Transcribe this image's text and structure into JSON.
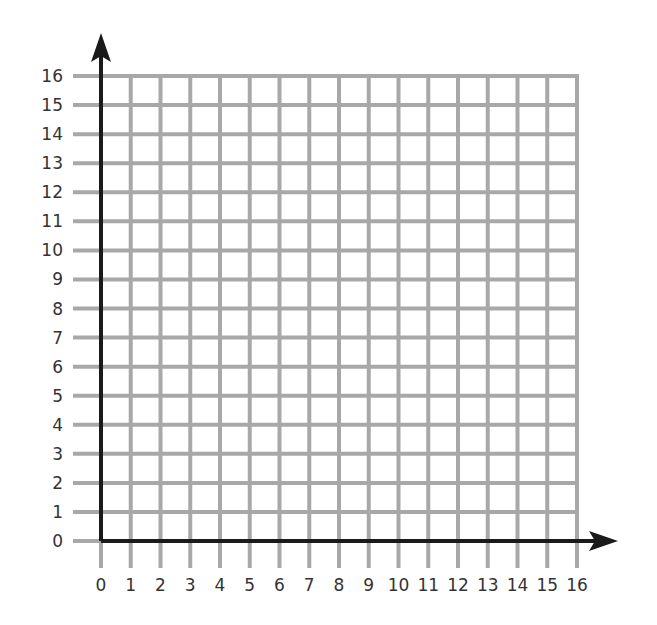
{
  "diagram": {
    "type": "coordinate-grid",
    "x_axis": {
      "min": 0,
      "max": 16,
      "step": 1,
      "labels": [
        "0",
        "1",
        "2",
        "3",
        "4",
        "5",
        "6",
        "7",
        "8",
        "9",
        "10",
        "11",
        "12",
        "13",
        "14",
        "15",
        "16"
      ]
    },
    "y_axis": {
      "min": 0,
      "max": 16,
      "step": 1,
      "labels": [
        "0",
        "1",
        "2",
        "3",
        "4",
        "5",
        "6",
        "7",
        "8",
        "9",
        "10",
        "11",
        "12",
        "13",
        "14",
        "15",
        "16"
      ]
    },
    "colors": {
      "grid": "#a8a8a8",
      "axis": "#1a1a1a",
      "labels": "#333333",
      "background": "#ffffff"
    }
  },
  "chart_data": {
    "type": "grid",
    "title": "",
    "xlabel": "",
    "ylabel": "",
    "xlim": [
      0,
      16
    ],
    "ylim": [
      0,
      16
    ],
    "grid": true,
    "x_ticks": [
      0,
      1,
      2,
      3,
      4,
      5,
      6,
      7,
      8,
      9,
      10,
      11,
      12,
      13,
      14,
      15,
      16
    ],
    "y_ticks": [
      0,
      1,
      2,
      3,
      4,
      5,
      6,
      7,
      8,
      9,
      10,
      11,
      12,
      13,
      14,
      15,
      16
    ],
    "series": []
  }
}
